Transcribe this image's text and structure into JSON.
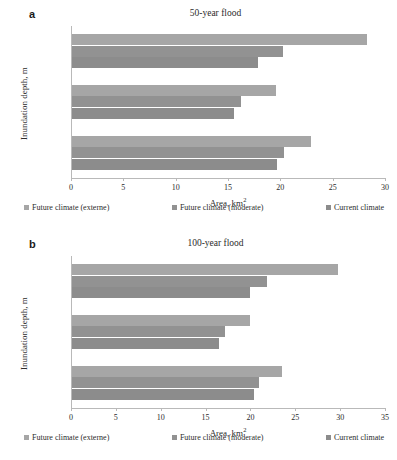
{
  "figure": {
    "panels": [
      {
        "panel_letter": "a",
        "title": "50-year flood",
        "xlabel_text": "Area, km",
        "xlabel_sup": "2",
        "ylabel": "Inundation depth, m"
      },
      {
        "panel_letter": "b",
        "title": "100-year flood",
        "xlabel_text": "Area, km",
        "xlabel_sup": "2",
        "ylabel": "Inundation depth, m"
      }
    ],
    "legend": [
      {
        "label": "Future climate (externe)",
        "color": "#a6a6a6"
      },
      {
        "label": "Future climate (moderate)",
        "color": "#929292"
      },
      {
        "label": "Current climate",
        "color": "#8c8c8c"
      }
    ]
  },
  "chart_data": [
    {
      "type": "bar",
      "orientation": "horizontal",
      "title": "50-year flood",
      "panel": "a",
      "xlabel": "Area, km2",
      "ylabel": "Inundation depth, m",
      "categories": [
        "0.1 - 0.5",
        "0.5 - 1.5",
        "> 1.5"
      ],
      "series": [
        {
          "name": "Future climate (externe)",
          "color": "#a6a6a6",
          "values": [
            22.8,
            19.5,
            28.2
          ]
        },
        {
          "name": "Future climate (moderate)",
          "color": "#929292",
          "values": [
            20.3,
            16.1,
            20.2
          ]
        },
        {
          "name": "Current climate",
          "color": "#8c8c8c",
          "values": [
            19.6,
            15.5,
            17.8
          ]
        }
      ],
      "xlim": [
        0,
        30
      ],
      "xticks": [
        0,
        5,
        10,
        15,
        20,
        25,
        30
      ],
      "grid": false,
      "legend_position": "bottom"
    },
    {
      "type": "bar",
      "orientation": "horizontal",
      "title": "100-year flood",
      "panel": "b",
      "xlabel": "Area, km2",
      "ylabel": "Inundation depth, m",
      "categories": [
        "0.1 - 0.5",
        "0.5 - 1.5",
        "> 1.5"
      ],
      "series": [
        {
          "name": "Future climate (externe)",
          "color": "#a6a6a6",
          "values": [
            23.4,
            19.8,
            29.6
          ]
        },
        {
          "name": "Future climate (moderate)",
          "color": "#929292",
          "values": [
            20.8,
            17.0,
            21.7
          ]
        },
        {
          "name": "Current climate",
          "color": "#8c8c8c",
          "values": [
            20.3,
            16.4,
            19.8
          ]
        }
      ],
      "xlim": [
        0,
        35
      ],
      "xticks": [
        0,
        5,
        10,
        15,
        20,
        25,
        30,
        35
      ],
      "grid": false,
      "legend_position": "bottom"
    }
  ]
}
